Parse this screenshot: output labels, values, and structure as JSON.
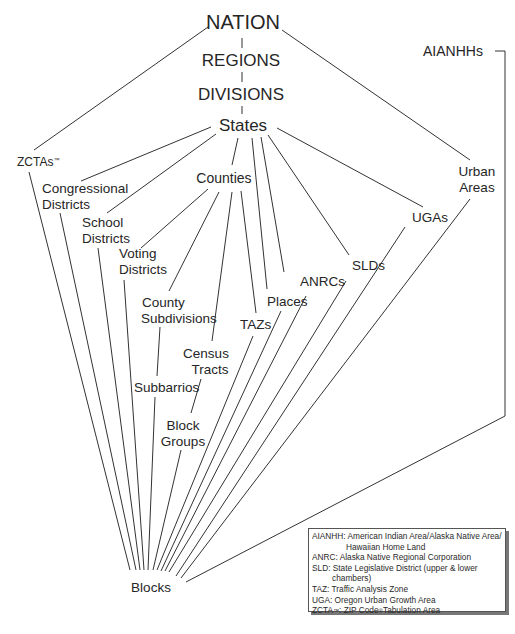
{
  "diagram": {
    "type": "hierarchy",
    "nodes": {
      "nation": "NATION",
      "regions": "REGIONS",
      "divisions": "DIVISIONS",
      "states": "States",
      "aianhhs": "AIANHHs",
      "zctas": "ZCTAs",
      "zctas_mark": "™",
      "congressional_1": "Congressional",
      "congressional_2": "Districts",
      "school_1": "School",
      "school_2": "Districts",
      "voting_1": "Voting",
      "voting_2": "Districts",
      "counties": "Counties",
      "urban_1": "Urban",
      "urban_2": "Areas",
      "ugas": "UGAs",
      "slds": "SLDs",
      "anrcs": "ANRCs",
      "places": "Places",
      "tazs": "TAZs",
      "county_sub_1": "County",
      "county_sub_2": "Subdivisions",
      "census_tracts_1": "Census",
      "census_tracts_2": "Tracts",
      "subbarrios": "Subbarrios",
      "block_groups_1": "Block",
      "block_groups_2": "Groups",
      "blocks": "Blocks"
    },
    "edges": [
      [
        "NATION",
        "REGIONS"
      ],
      [
        "REGIONS",
        "DIVISIONS"
      ],
      [
        "DIVISIONS",
        "States"
      ],
      [
        "NATION",
        "ZCTAs"
      ],
      [
        "NATION",
        "Urban Areas"
      ],
      [
        "States",
        "Congressional Districts"
      ],
      [
        "States",
        "School Districts"
      ],
      [
        "States",
        "Counties"
      ],
      [
        "States",
        "Places"
      ],
      [
        "States",
        "ANRCs"
      ],
      [
        "States",
        "SLDs"
      ],
      [
        "States",
        "UGAs"
      ],
      [
        "States",
        "TAZs"
      ],
      [
        "Counties",
        "Voting Districts"
      ],
      [
        "Counties",
        "County Subdivisions"
      ],
      [
        "Counties",
        "Census Tracts"
      ],
      [
        "Counties",
        "TAZs"
      ],
      [
        "County Subdivisions",
        "Subbarrios"
      ],
      [
        "Census Tracts",
        "Block Groups"
      ],
      [
        "ZCTAs",
        "Blocks"
      ],
      [
        "Congressional Districts",
        "Blocks"
      ],
      [
        "School Districts",
        "Blocks"
      ],
      [
        "Voting Districts",
        "Blocks"
      ],
      [
        "Subbarrios",
        "Blocks"
      ],
      [
        "Block Groups",
        "Blocks"
      ],
      [
        "TAZs",
        "Blocks"
      ],
      [
        "Places",
        "Blocks"
      ],
      [
        "ANRCs",
        "Blocks"
      ],
      [
        "SLDs",
        "Blocks"
      ],
      [
        "UGAs",
        "Blocks"
      ],
      [
        "Urban Areas",
        "Blocks"
      ],
      [
        "AIANHHs",
        "Blocks"
      ]
    ]
  },
  "legend": {
    "aianhh_1": "AIANHH: American Indian Area/Alaska Native Area/",
    "aianhh_2": "Hawaiian Home Land",
    "anrc": "ANRC: Alaska Native Regional Corporation",
    "sld_1": "SLD: State Legislative District (upper & lower",
    "sld_2": "chambers)",
    "taz": "TAZ: Traffic Analysis Zone",
    "uga": "UGA: Oregon Urban Growth Area",
    "zcta_prefix": "ZCTA",
    "zcta_tm": "™",
    "zcta_mid": ": ZIP Code",
    "zcta_reg": "®",
    "zcta_suffix": "Tabulation Area"
  },
  "colors": {
    "line": "#333333",
    "text": "#262626",
    "background": "#ffffff"
  }
}
